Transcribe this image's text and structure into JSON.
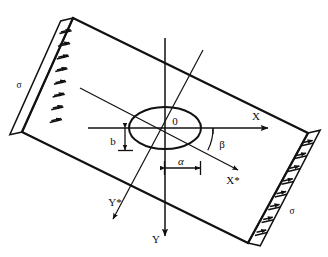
{
  "figure": {
    "background_color": "#ffffff",
    "line_color": "#111111",
    "width": 328,
    "height": 257
  },
  "labels": {
    "sigma_left": "σ",
    "sigma_right": "σ",
    "origin": "0",
    "axis_x": "X",
    "axis_y": "Y",
    "axis_x_star": "X*",
    "axis_y_star": "Y*",
    "angle_beta": "β",
    "dim_a": "α",
    "dim_b": "b"
  },
  "geometry": {
    "plate_rotation_deg": -38,
    "plate_corners": [
      [
        73,
        18
      ],
      [
        308,
        133
      ],
      [
        248,
        243
      ],
      [
        22,
        132
      ]
    ],
    "plate_center": [
      165,
      128
    ],
    "ellipse_center": [
      165,
      128
    ],
    "ellipse_rx": 36,
    "ellipse_ry": 21,
    "ellipse_rotation_deg": 0,
    "hatch_boxes_left": 9,
    "hatch_boxes_right": 9,
    "x_axis": {
      "from": [
        88,
        128
      ],
      "to": [
        268,
        128
      ],
      "arrow": "to"
    },
    "y_axis": {
      "from": [
        165,
        38
      ],
      "to": [
        165,
        236
      ],
      "arrow": "to"
    },
    "x_star_axis": {
      "from": [
        80,
        88
      ],
      "to": [
        238,
        170
      ],
      "arrow": "to"
    },
    "y_star_axis": {
      "from": [
        203,
        50
      ],
      "to": [
        113,
        219
      ],
      "arrow": "to"
    },
    "beta_angle_deg": 27,
    "dim_a_span": {
      "from": [
        165,
        168
      ],
      "to": [
        200,
        168
      ]
    },
    "dim_b_span": {
      "from": [
        125,
        128
      ],
      "to": [
        125,
        150
      ]
    }
  },
  "icons": {
    "arrowhead": "arrow-head-icon",
    "hatch": "hatch-box-icon"
  }
}
